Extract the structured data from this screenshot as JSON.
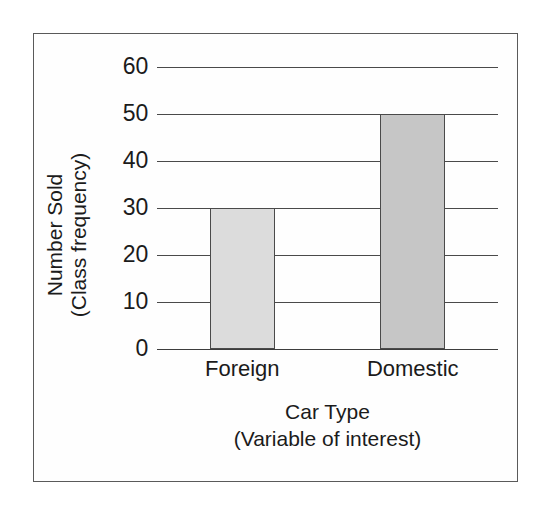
{
  "chart_data": {
    "type": "bar",
    "title": "",
    "categories": [
      "Foreign",
      "Domestic"
    ],
    "values": [
      30,
      50
    ],
    "series": [
      {
        "name": "Number Sold",
        "values": [
          30,
          50
        ]
      }
    ],
    "xlabel": "Car Type",
    "xlabel_sub": "(Variable of interest)",
    "ylabel": "Number Sold",
    "ylabel_sub": "(Class frequency)",
    "ylim": [
      0,
      60
    ],
    "ytick_values": [
      60,
      50,
      40,
      30,
      20,
      10,
      0
    ],
    "ytick_labels": [
      "60",
      "50",
      "40",
      "30",
      "20",
      "10",
      "0"
    ],
    "ytick_step": 10,
    "grid": true,
    "grid_axis": "y",
    "legend": false,
    "legend_position": "none",
    "bar_colors": [
      "#dcdcdc",
      "#c6c6c6"
    ],
    "bar_edge_color": "#4a4a4a",
    "gridline_color": "#4a4a4a",
    "axis_color": "#3d3d3d",
    "frame_color": "#5a5a5a",
    "background_color": "#ffffff",
    "text_color": "#1b1b1b"
  },
  "axes": {
    "y": {
      "title_line1": "Number Sold",
      "title_line2": "(Class frequency)",
      "ticks": [
        "60",
        "50",
        "40",
        "30",
        "20",
        "10",
        "0"
      ]
    },
    "x": {
      "title_line1": "Car Type",
      "title_line2": "(Variable of interest)",
      "ticks": [
        "Foreign",
        "Domestic"
      ]
    }
  },
  "bars": [
    {
      "label": "Foreign",
      "value": 30,
      "color": "#dcdcdc"
    },
    {
      "label": "Domestic",
      "value": 50,
      "color": "#c6c6c6"
    }
  ]
}
